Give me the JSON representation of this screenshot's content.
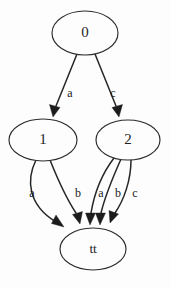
{
  "diagram": {
    "type": "state-transition-graph",
    "title": "",
    "background_color": "#fdfdfd",
    "stroke_color": "#262626",
    "node_fill_color": "#fdfdfd",
    "nodes": [
      {
        "id": "n0",
        "label": "0",
        "cx": 85,
        "cy": 33,
        "rx": 33,
        "ry": 22
      },
      {
        "id": "n1",
        "label": "1",
        "cx": 43,
        "cy": 140,
        "rx": 34,
        "ry": 21
      },
      {
        "id": "n2",
        "label": "2",
        "cx": 128,
        "cy": 140,
        "rx": 32,
        "ry": 20
      },
      {
        "id": "ntt",
        "label": "tt",
        "cx": 93,
        "cy": 249,
        "rx": 33,
        "ry": 21
      }
    ],
    "edges": [
      {
        "id": "e0",
        "from": "n0",
        "to": "n1",
        "label": "a",
        "label_x": 70,
        "label_y": 94
      },
      {
        "id": "e1",
        "from": "n0",
        "to": "n2",
        "label": "c",
        "label_x": 113,
        "label_y": 94
      },
      {
        "id": "e2",
        "from": "n1",
        "to": "ntt",
        "label": "a",
        "label_x": 32,
        "label_y": 194
      },
      {
        "id": "e3",
        "from": "n1",
        "to": "ntt",
        "label": "b",
        "label_x": 78,
        "label_y": 194
      },
      {
        "id": "e4",
        "from": "n2",
        "to": "ntt",
        "label": "a",
        "label_x": 101,
        "label_y": 194
      },
      {
        "id": "e5",
        "from": "n2",
        "to": "ntt",
        "label": "b",
        "label_x": 118,
        "label_y": 194
      },
      {
        "id": "e6",
        "from": "n2",
        "to": "ntt",
        "label": "c",
        "label_x": 135,
        "label_y": 194
      }
    ]
  }
}
